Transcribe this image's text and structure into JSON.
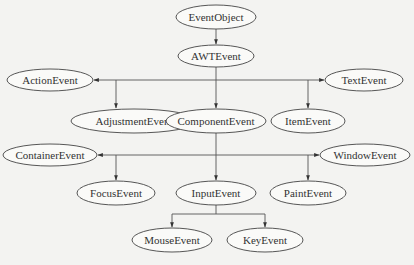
{
  "diagram": {
    "type": "class-hierarchy-tree",
    "nodes": [
      {
        "id": "EventObject",
        "label": "EventObject",
        "cx": 216,
        "cy": 17,
        "rx": 40,
        "ry": 12
      },
      {
        "id": "AWTEvent",
        "label": "AWTEvent",
        "cx": 216,
        "cy": 56,
        "rx": 38,
        "ry": 11
      },
      {
        "id": "ActionEvent",
        "label": "ActionEvent",
        "cx": 50,
        "cy": 80,
        "rx": 43,
        "ry": 11
      },
      {
        "id": "TextEvent",
        "label": "TextEvent",
        "cx": 364,
        "cy": 80,
        "rx": 39,
        "ry": 11
      },
      {
        "id": "AdjustmentEvent",
        "label": "AdjustmentEvent",
        "cx": 134,
        "cy": 121,
        "rx": 63,
        "ry": 12
      },
      {
        "id": "ComponentEvent",
        "label": "ComponentEvent",
        "cx": 216,
        "cy": 121,
        "rx": 50,
        "ry": 12
      },
      {
        "id": "ItemEvent",
        "label": "ItemEvent",
        "cx": 308,
        "cy": 121,
        "rx": 37,
        "ry": 12
      },
      {
        "id": "ContainerEvent",
        "label": "ContainerEvent",
        "cx": 50,
        "cy": 155,
        "rx": 47,
        "ry": 11
      },
      {
        "id": "WindowEvent",
        "label": "WindowEvent",
        "cx": 365,
        "cy": 155,
        "rx": 45,
        "ry": 11
      },
      {
        "id": "FocusEvent",
        "label": "FocusEvent",
        "cx": 116,
        "cy": 193,
        "rx": 39,
        "ry": 12
      },
      {
        "id": "InputEvent",
        "label": "InputEvent",
        "cx": 216,
        "cy": 193,
        "rx": 40,
        "ry": 12
      },
      {
        "id": "PaintEvent",
        "label": "PaintEvent",
        "cx": 308,
        "cy": 193,
        "rx": 38,
        "ry": 12
      },
      {
        "id": "MouseEvent",
        "label": "MouseEvent",
        "cx": 172,
        "cy": 240,
        "rx": 40,
        "ry": 12
      },
      {
        "id": "KeyEvent",
        "label": "KeyEvent",
        "cx": 265,
        "cy": 240,
        "rx": 38,
        "ry": 12
      }
    ],
    "edges": [
      {
        "from": "EventObject",
        "to": "AWTEvent"
      },
      {
        "from": "AWTEvent",
        "to": "ActionEvent"
      },
      {
        "from": "AWTEvent",
        "to": "TextEvent"
      },
      {
        "from": "AWTEvent",
        "to": "AdjustmentEvent"
      },
      {
        "from": "AWTEvent",
        "to": "ComponentEvent"
      },
      {
        "from": "AWTEvent",
        "to": "ItemEvent"
      },
      {
        "from": "ComponentEvent",
        "to": "ContainerEvent"
      },
      {
        "from": "ComponentEvent",
        "to": "WindowEvent"
      },
      {
        "from": "ComponentEvent",
        "to": "FocusEvent"
      },
      {
        "from": "ComponentEvent",
        "to": "InputEvent"
      },
      {
        "from": "ComponentEvent",
        "to": "PaintEvent"
      },
      {
        "from": "InputEvent",
        "to": "MouseEvent"
      },
      {
        "from": "InputEvent",
        "to": "KeyEvent"
      }
    ]
  },
  "colors": {
    "background": "#f3f3f1",
    "stroke": "#444444",
    "text": "#333333"
  }
}
